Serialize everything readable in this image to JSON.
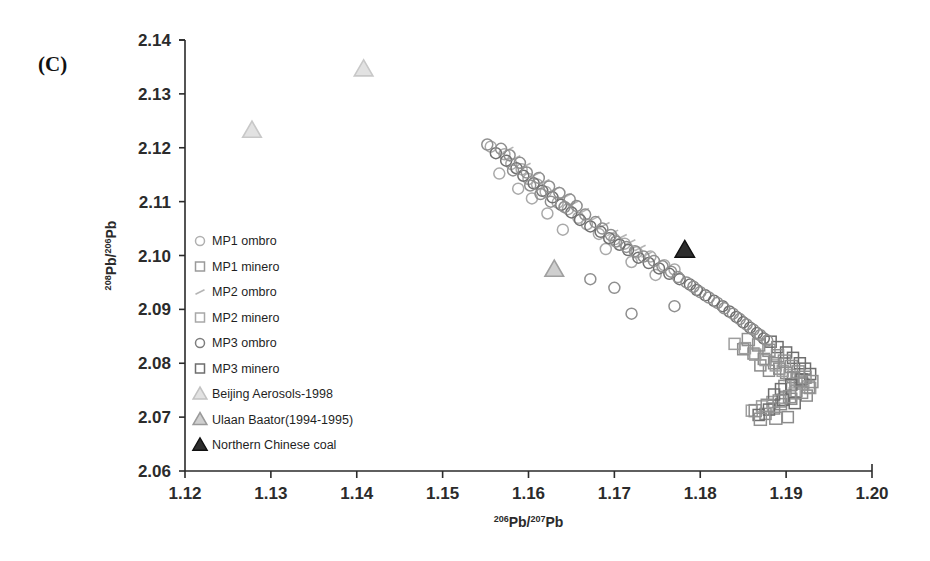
{
  "figure": {
    "panel_label": "(C)",
    "background": "#ffffff"
  },
  "chart_data": {
    "type": "scatter",
    "title": "",
    "panel": "(C)",
    "xlabel": "206Pb/207Pb",
    "ylabel": "208Pb/206Pb",
    "xlabel_parts": {
      "sup1": "206",
      "base1": "Pb/",
      "sup2": "207",
      "base2": "Pb"
    },
    "ylabel_parts": {
      "sup1": "208",
      "base1": "Pb/",
      "sup2": "206",
      "base2": "Pb"
    },
    "xlim": [
      1.12,
      1.2
    ],
    "ylim": [
      2.06,
      2.14
    ],
    "xticks": [
      "1.12",
      "1.13",
      "1.14",
      "1.15",
      "1.16",
      "1.17",
      "1.18",
      "1.19",
      "1.20"
    ],
    "yticks": [
      "2.06",
      "2.07",
      "2.08",
      "2.09",
      "2.10",
      "2.11",
      "2.12",
      "2.13",
      "2.14"
    ],
    "grid": false,
    "legend_position": "inside-left",
    "series": [
      {
        "name": "MP1 ombro",
        "marker": "circle-open",
        "color": "#a9a9a9",
        "points": [
          [
            1.1556,
            2.1202
          ],
          [
            1.1572,
            2.1188
          ],
          [
            1.158,
            2.117
          ],
          [
            1.1592,
            2.116
          ],
          [
            1.1566,
            2.1152
          ],
          [
            1.16,
            2.1142
          ],
          [
            1.161,
            2.1132
          ],
          [
            1.1588,
            2.1124
          ],
          [
            1.162,
            2.1118
          ],
          [
            1.1604,
            2.1106
          ],
          [
            1.1634,
            2.1098
          ],
          [
            1.1646,
            2.1086
          ],
          [
            1.1622,
            2.1078
          ],
          [
            1.1658,
            2.107
          ],
          [
            1.1668,
            2.1058
          ],
          [
            1.164,
            2.1048
          ],
          [
            1.1682,
            2.104
          ],
          [
            1.17,
            2.103
          ],
          [
            1.1712,
            2.1022
          ],
          [
            1.169,
            2.1012
          ],
          [
            1.1726,
            2.1006
          ],
          [
            1.1742,
            2.0998
          ],
          [
            1.172,
            2.0988
          ],
          [
            1.1758,
            2.0982
          ],
          [
            1.177,
            2.0974
          ],
          [
            1.1748,
            2.0964
          ]
        ]
      },
      {
        "name": "MP1 minero",
        "marker": "square-open",
        "color": "#8c8c8c",
        "points": [
          [
            1.185,
            2.0826
          ],
          [
            1.1862,
            2.0818
          ],
          [
            1.1874,
            2.0808
          ],
          [
            1.1886,
            2.08
          ],
          [
            1.1892,
            2.079
          ],
          [
            1.19,
            2.0782
          ],
          [
            1.1908,
            2.0774
          ],
          [
            1.1916,
            2.0766
          ],
          [
            1.188,
            2.0786
          ],
          [
            1.187,
            2.0796
          ],
          [
            1.1898,
            2.0758
          ],
          [
            1.1912,
            2.0748
          ],
          [
            1.1924,
            2.074
          ],
          [
            1.1906,
            2.0734
          ],
          [
            1.1894,
            2.0724
          ],
          [
            1.1886,
            2.0716
          ],
          [
            1.1876,
            2.0706
          ],
          [
            1.1902,
            2.07
          ]
        ]
      },
      {
        "name": "MP2 ombro",
        "marker": "dash-small",
        "color": "#b5b5b5",
        "points": [
          [
            1.1576,
            2.1196
          ],
          [
            1.1584,
            2.118
          ],
          [
            1.1596,
            2.1166
          ],
          [
            1.1608,
            2.115
          ],
          [
            1.1618,
            2.1136
          ],
          [
            1.163,
            2.1122
          ],
          [
            1.1644,
            2.111
          ],
          [
            1.1652,
            2.1096
          ],
          [
            1.1664,
            2.1082
          ],
          [
            1.1676,
            2.1068
          ],
          [
            1.1688,
            2.1056
          ],
          [
            1.1698,
            2.1042
          ],
          [
            1.1708,
            2.1034
          ],
          [
            1.1718,
            2.1024
          ],
          [
            1.173,
            2.1014
          ],
          [
            1.1738,
            2.1002
          ]
        ]
      },
      {
        "name": "MP2 minero",
        "marker": "square-open",
        "color": "#9e9e9e",
        "points": [
          [
            1.184,
            2.0836
          ],
          [
            1.1852,
            2.0828
          ],
          [
            1.1864,
            2.0816
          ],
          [
            1.1876,
            2.0806
          ],
          [
            1.1888,
            2.0796
          ],
          [
            1.1896,
            2.0786
          ],
          [
            1.1904,
            2.0778
          ],
          [
            1.1912,
            2.077
          ],
          [
            1.192,
            2.0762
          ],
          [
            1.1928,
            2.0754
          ],
          [
            1.191,
            2.0744
          ],
          [
            1.1898,
            2.0736
          ],
          [
            1.1884,
            2.0728
          ],
          [
            1.1872,
            2.072
          ],
          [
            1.186,
            2.0712
          ]
        ]
      },
      {
        "name": "MP3 ombro",
        "marker": "circle-open",
        "color": "#707070",
        "points": [
          [
            1.1562,
            2.119
          ],
          [
            1.1574,
            2.1176
          ],
          [
            1.1586,
            2.1162
          ],
          [
            1.1594,
            2.1148
          ],
          [
            1.1606,
            2.1134
          ],
          [
            1.1616,
            2.112
          ],
          [
            1.1628,
            2.1108
          ],
          [
            1.1638,
            2.1094
          ],
          [
            1.165,
            2.108
          ],
          [
            1.166,
            2.1066
          ],
          [
            1.1672,
            2.1054
          ],
          [
            1.1684,
            2.1044
          ],
          [
            1.1694,
            2.1032
          ],
          [
            1.1706,
            2.102
          ],
          [
            1.1716,
            2.101
          ],
          [
            1.1728,
            2.0996
          ],
          [
            1.174,
            2.0986
          ],
          [
            1.1752,
            2.0976
          ],
          [
            1.1764,
            2.0966
          ],
          [
            1.1776,
            2.0956
          ],
          [
            1.1788,
            2.0946
          ],
          [
            1.1796,
            2.0936
          ],
          [
            1.1806,
            2.0926
          ],
          [
            1.1816,
            2.0916
          ],
          [
            1.1826,
            2.0906
          ],
          [
            1.1834,
            2.0896
          ],
          [
            1.1842,
            2.0886
          ],
          [
            1.185,
            2.0876
          ],
          [
            1.1858,
            2.0866
          ],
          [
            1.1866,
            2.0856
          ],
          [
            1.1874,
            2.0846
          ]
        ]
      },
      {
        "name": "MP3 minero",
        "marker": "square-open",
        "color": "#6e6e6e",
        "points": [
          [
            1.1882,
            2.084
          ],
          [
            1.189,
            2.083
          ],
          [
            1.19,
            2.082
          ],
          [
            1.1908,
            2.081
          ],
          [
            1.1916,
            2.08
          ],
          [
            1.1922,
            2.079
          ],
          [
            1.1928,
            2.078
          ],
          [
            1.1918,
            2.077
          ],
          [
            1.1906,
            2.076
          ],
          [
            1.1894,
            2.0752
          ],
          [
            1.1886,
            2.0742
          ],
          [
            1.1896,
            2.0732
          ],
          [
            1.191,
            2.0726
          ],
          [
            1.188,
            2.0714
          ],
          [
            1.1868,
            2.0704
          ]
        ]
      },
      {
        "name": "Beijing Aerosols-1998",
        "marker": "triangle-light",
        "color": "#c8c8c8",
        "points": [
          [
            1.1278,
            2.1232
          ],
          [
            1.1408,
            2.1346
          ]
        ]
      },
      {
        "name": "Ulaan Baator(1994-1995)",
        "marker": "triangle-gray",
        "color": "#a0a0a0",
        "points": [
          [
            1.163,
            2.0974
          ]
        ]
      },
      {
        "name": "Northern Chinese coal",
        "marker": "triangle-dark",
        "color": "#2b2b2b",
        "points": [
          [
            1.1782,
            2.101
          ]
        ]
      }
    ],
    "extra_points": {
      "description": "additional scatter fill of the diagonal cloud",
      "circles": [
        [
          1.1552,
          2.1206
        ],
        [
          1.1568,
          2.1198
        ],
        [
          1.1578,
          2.1186
        ],
        [
          1.159,
          2.1172
        ],
        [
          1.1582,
          2.1158
        ],
        [
          1.1598,
          2.1154
        ],
        [
          1.1612,
          2.1144
        ],
        [
          1.1602,
          2.113
        ],
        [
          1.1624,
          2.1128
        ],
        [
          1.1614,
          2.1114
        ],
        [
          1.1636,
          2.1116
        ],
        [
          1.1626,
          2.11
        ],
        [
          1.1648,
          2.1104
        ],
        [
          1.1642,
          2.109
        ],
        [
          1.1656,
          2.1092
        ],
        [
          1.1666,
          2.1076
        ],
        [
          1.1678,
          2.1062
        ],
        [
          1.1686,
          2.105
        ],
        [
          1.1696,
          2.1038
        ],
        [
          1.1702,
          2.1026
        ],
        [
          1.1714,
          2.1016
        ],
        [
          1.1724,
          2.1008
        ],
        [
          1.1734,
          2.0998
        ],
        [
          1.1746,
          2.099
        ],
        [
          1.1756,
          2.098
        ],
        [
          1.1766,
          2.097
        ],
        [
          1.1774,
          2.096
        ],
        [
          1.1784,
          2.095
        ],
        [
          1.1792,
          2.0942
        ],
        [
          1.18,
          2.0932
        ],
        [
          1.181,
          2.0922
        ],
        [
          1.182,
          2.0912
        ],
        [
          1.1828,
          2.0902
        ],
        [
          1.1838,
          2.0892
        ],
        [
          1.1846,
          2.0882
        ],
        [
          1.1854,
          2.0872
        ],
        [
          1.1862,
          2.0862
        ],
        [
          1.187,
          2.0852
        ],
        [
          1.1878,
          2.0842
        ],
        [
          1.172,
          2.0892
        ],
        [
          1.17,
          2.094
        ],
        [
          1.1672,
          2.0956
        ],
        [
          1.177,
          2.0906
        ]
      ],
      "squares": [
        [
          1.1856,
          2.0844
        ],
        [
          1.1868,
          2.0834
        ],
        [
          1.188,
          2.0824
        ],
        [
          1.189,
          2.0814
        ],
        [
          1.1898,
          2.0804
        ],
        [
          1.1906,
          2.0794
        ],
        [
          1.1914,
          2.0784
        ],
        [
          1.1922,
          2.0774
        ],
        [
          1.193,
          2.0766
        ],
        [
          1.1926,
          2.0756
        ],
        [
          1.1918,
          2.0746
        ],
        [
          1.1904,
          2.0738
        ],
        [
          1.1892,
          2.073
        ],
        [
          1.1878,
          2.0722
        ],
        [
          1.1864,
          2.0712
        ],
        [
          1.1888,
          2.0698
        ],
        [
          1.187,
          2.0696
        ]
      ]
    }
  },
  "legend": {
    "items": [
      {
        "label": "MP1 ombro",
        "marker": "circle-open",
        "color": "#b0b0b0"
      },
      {
        "label": "MP1 minero",
        "marker": "square-open",
        "color": "#9a9a9a"
      },
      {
        "label": "MP2 ombro",
        "marker": "dash-small",
        "color": "#b5b5b5"
      },
      {
        "label": "MP2 minero",
        "marker": "square-open",
        "color": "#a8a8a8"
      },
      {
        "label": "MP3 ombro",
        "marker": "circle-open",
        "color": "#7d7d7d"
      },
      {
        "label": "MP3 minero",
        "marker": "square-open",
        "color": "#6e6e6e"
      },
      {
        "label": "Beijing Aerosols-1998",
        "marker": "triangle-light",
        "color": "#c2c2c2"
      },
      {
        "label": "Ulaan Baator(1994-1995)",
        "marker": "triangle-gray",
        "color": "#9a9a9a"
      },
      {
        "label": "Northern Chinese coal",
        "marker": "triangle-dark",
        "color": "#2b2b2b"
      }
    ]
  }
}
